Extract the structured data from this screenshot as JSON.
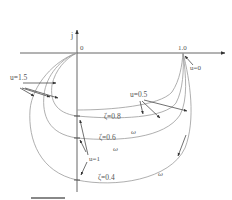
{
  "diagram": {
    "type": "nyquist-plot",
    "axes": {
      "imag_label": "j",
      "origin_label": "0",
      "real_tick_label": "1.0"
    },
    "labels": {
      "u_0": "u=0",
      "u_05": "u=0.5",
      "u_1": "u=1",
      "u_15": "u=1.5",
      "zeta_08": "ζ=0.8",
      "zeta_06": "ζ=0.6",
      "zeta_04": "ζ=0.4",
      "omega_1": "ω",
      "omega_2": "ω",
      "omega_3": "ω"
    },
    "curves": [
      {
        "zeta": 0.8
      },
      {
        "zeta": 0.6
      },
      {
        "zeta": 0.4
      }
    ],
    "colors": {
      "axis": "#555555",
      "curve": "#9a9a9a",
      "arrow": "#333333",
      "scale_bar": "#888888"
    }
  }
}
